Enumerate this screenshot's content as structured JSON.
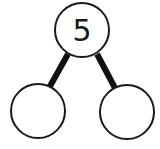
{
  "diagram": {
    "type": "number-bond",
    "whole": {
      "label": "5"
    },
    "parts": [
      {
        "label": ""
      },
      {
        "label": ""
      }
    ],
    "colors": {
      "stroke": "#1a1a1a",
      "fill": "#ffffff"
    }
  }
}
